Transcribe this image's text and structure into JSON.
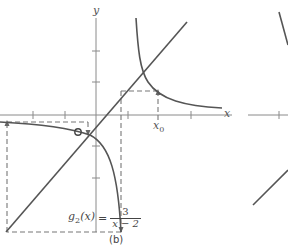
{
  "figure": {
    "panel_label": "(b)",
    "x_axis_label": "x",
    "y_axis_label": "y",
    "x0_label": {
      "base": "x",
      "subscript": "0"
    },
    "formula": {
      "function_name": "g",
      "function_subscript": "2",
      "argument": "(x)",
      "equals": "=",
      "numerator": "3",
      "denominator": "x − 2"
    },
    "curves": [
      {
        "name": "identity-line",
        "equation": "y = x"
      },
      {
        "name": "g2-curve",
        "equation": "g2(x) = 3/(x-2)"
      }
    ],
    "colors": {
      "curve": "#555555",
      "axis": "#888888",
      "dashed": "#777777",
      "text": "#444444"
    }
  }
}
